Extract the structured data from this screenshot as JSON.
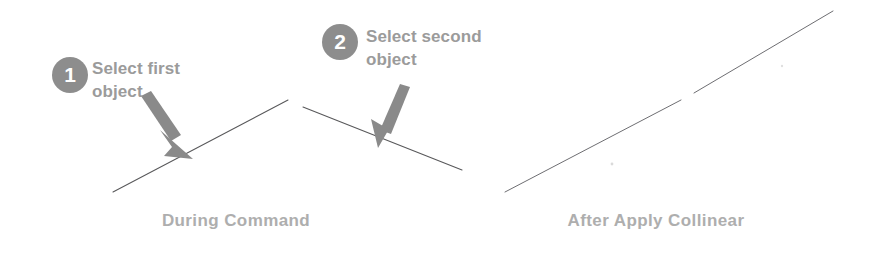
{
  "figure": {
    "width": 878,
    "height": 256,
    "background_color": "#ffffff",
    "title_context": "Collinear constraint - before and after"
  },
  "colors": {
    "badge_fill": "#8d8d8d",
    "badge_number": "#ffffff",
    "callout_text": "#9b9b9b",
    "caption_text": "#aeaeae",
    "arrow_fill": "#8a8a8a",
    "geometry_line": "#58585a"
  },
  "panels": [
    {
      "id": "during-command",
      "caption": "During Command",
      "steps": [
        {
          "badge": "1",
          "text": "Select first\nobject",
          "arrow_name": "arrow-step-1",
          "arrow_direction": "down-right"
        },
        {
          "badge": "2",
          "text": "Select second\nobject",
          "arrow_name": "arrow-step-2",
          "arrow_direction": "down-left"
        }
      ],
      "geometry": {
        "description": "two non-collinear line segments meeting at a vertex",
        "segments": [
          {
            "name": "first-object-line",
            "x1": 113,
            "y1": 192,
            "x2": 288,
            "y2": 100
          },
          {
            "name": "second-object-line",
            "x1": 303,
            "y1": 107,
            "x2": 462,
            "y2": 170
          }
        ]
      }
    },
    {
      "id": "after-apply-collinear",
      "caption": "After Apply Collinear",
      "steps": [],
      "geometry": {
        "description": "two collinear line segments with a small gap",
        "segments": [
          {
            "name": "first-object-line-collinear",
            "x1": 505,
            "y1": 192,
            "x2": 681,
            "y2": 100
          },
          {
            "name": "second-object-line-collinear",
            "x1": 694,
            "y1": 93,
            "x2": 833,
            "y2": 11
          }
        ]
      }
    }
  ],
  "arrows": [
    {
      "name": "arrow-step-1",
      "points_to": "first-object-line",
      "tail_x": 143,
      "tail_y": 99,
      "tip_x": 190,
      "tip_y": 156
    },
    {
      "name": "arrow-step-2",
      "points_to": "second-object-line",
      "tail_x": 404,
      "tail_y": 88,
      "tip_x": 381,
      "tip_y": 145
    }
  ]
}
